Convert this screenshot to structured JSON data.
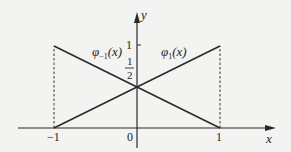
{
  "chart_data": {
    "type": "line",
    "title": "",
    "xlabel": "x",
    "ylabel": "y",
    "xlim": [
      -1,
      1
    ],
    "ylim": [
      0,
      1
    ],
    "grid": false,
    "x_ticks": [
      {
        "value": -1,
        "label": "−1"
      },
      {
        "value": 0,
        "label": "0"
      },
      {
        "value": 1,
        "label": "1"
      }
    ],
    "y_ticks": [
      {
        "value": 1,
        "label": "1"
      },
      {
        "value": 0.5,
        "label_num": "1",
        "label_den": "2"
      }
    ],
    "series": [
      {
        "name": "phi_-1",
        "label_base": "φ",
        "label_sub": "−1",
        "label_arg": "(x)",
        "points": [
          [
            -1,
            1
          ],
          [
            1,
            0
          ]
        ]
      },
      {
        "name": "phi_1",
        "label_base": "φ",
        "label_sub": "1",
        "label_arg": "(x)",
        "points": [
          [
            -1,
            0
          ],
          [
            1,
            1
          ]
        ]
      }
    ],
    "reference_lines": [
      {
        "type": "vertical-dashed",
        "x": -1,
        "from_y": 0,
        "to_y": 1
      },
      {
        "type": "vertical-dashed",
        "x": 1,
        "from_y": 0,
        "to_y": 1
      }
    ],
    "intersection": [
      0,
      0.5
    ]
  }
}
